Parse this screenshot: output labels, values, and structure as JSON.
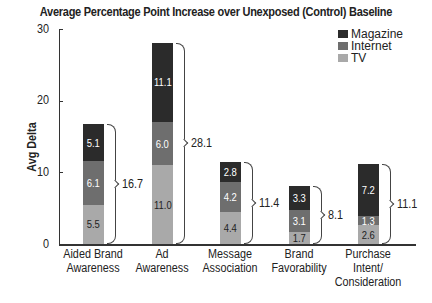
{
  "chart_data": {
    "type": "bar",
    "stacked": true,
    "title": "Average Percentage Point Increase over Unexposed (Control) Baseline",
    "xlabel": "",
    "ylabel": "Avg Delta",
    "ylim": [
      0,
      30
    ],
    "yticks": [
      "0",
      "10",
      "20",
      "30"
    ],
    "grid": false,
    "legend_position": "top-right",
    "categories": [
      "Aided Brand Awareness",
      "Ad Awareness",
      "Message Association",
      "Brand Favorability",
      "Purchase Intent/ Consideration"
    ],
    "category_lines": [
      [
        "Aided Brand",
        "Awareness"
      ],
      [
        "Ad",
        "Awareness"
      ],
      [
        "Message",
        "Association"
      ],
      [
        "Brand",
        "Favorability"
      ],
      [
        "Purchase",
        "Intent/",
        "Consideration"
      ]
    ],
    "series": [
      {
        "name": "TV",
        "color": "#a9a9a9",
        "values": [
          5.5,
          11.0,
          4.4,
          1.7,
          2.6
        ],
        "labels": [
          "5.5",
          "11.0",
          "4.4",
          "1.7",
          "2.6"
        ]
      },
      {
        "name": "Internet",
        "color": "#6e6e6e",
        "values": [
          6.1,
          6.0,
          4.2,
          3.1,
          1.3
        ],
        "labels": [
          "6.1",
          "6.0",
          "4.2",
          "3.1",
          "1.3"
        ]
      },
      {
        "name": "Magazine",
        "color": "#2b2b2b",
        "values": [
          5.1,
          11.1,
          2.8,
          3.3,
          7.2
        ],
        "labels": [
          "5.1",
          "11.1",
          "2.8",
          "3.3",
          "7.2"
        ]
      }
    ],
    "totals": [
      16.7,
      28.1,
      11.4,
      8.1,
      11.1
    ],
    "total_labels": [
      "16.7",
      "28.1",
      "11.4",
      "8.1",
      "11.1"
    ],
    "legend": [
      "Magazine",
      "Internet",
      "TV"
    ]
  }
}
